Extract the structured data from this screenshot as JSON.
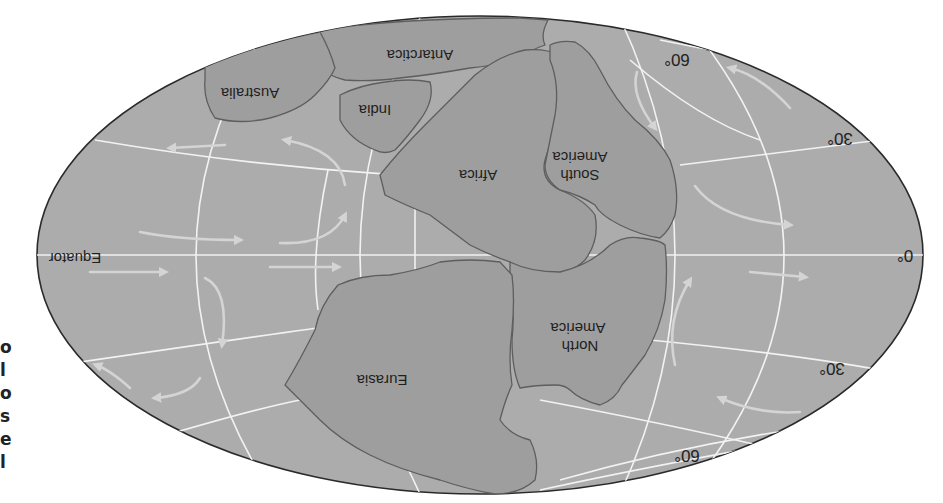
{
  "map": {
    "title": "Pangaea (rotated 180°)",
    "orientation": "upside-down",
    "continents": [
      {
        "id": "antarctica",
        "label": "Antarctica"
      },
      {
        "id": "australia",
        "label": "Australia"
      },
      {
        "id": "india",
        "label": "India"
      },
      {
        "id": "africa",
        "label": "Africa"
      },
      {
        "id": "south-america",
        "label_line1": "South",
        "label_line2": "America"
      },
      {
        "id": "north-america",
        "label_line1": "North",
        "label_line2": "America"
      },
      {
        "id": "eurasia",
        "label": "Eurasia"
      }
    ],
    "equator_label": "Equator",
    "latitude_labels": {
      "lat60_top": "60°",
      "lat30_top": "30°",
      "lat0": "0°",
      "lat30_bottom": "30°",
      "lat60_bottom": "60°"
    },
    "colors": {
      "ocean": "#acacac",
      "land": "#9e9e9e",
      "coastline": "#5e5e5e",
      "gridlines": "#f2f2f2",
      "current_arrows": "#d4d4d4"
    }
  },
  "edge_text": [
    "o",
    "l",
    "o",
    "s",
    "e",
    "l"
  ]
}
